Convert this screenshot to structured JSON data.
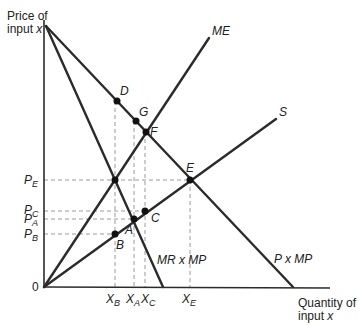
{
  "axes": {
    "y_label_line1": "Price of",
    "y_label_line2": "input ",
    "y_label_var": "x",
    "x_label_line1": "Quantity of",
    "x_label_line2": "input ",
    "x_label_var": "x",
    "origin": "0"
  },
  "curves": {
    "me": "ME",
    "s": "S",
    "mr_mp": "MR x MP",
    "p_mp": "P x MP"
  },
  "points": {
    "A": "A",
    "B": "B",
    "C": "C",
    "D": "D",
    "E": "E",
    "F": "F",
    "G": "G"
  },
  "y_ticks": {
    "pe": {
      "main": "P",
      "sub": "E"
    },
    "pc": {
      "main": "P",
      "sub": "C"
    },
    "pa": {
      "main": "P",
      "sub": "A"
    },
    "pb": {
      "main": "P",
      "sub": "B"
    }
  },
  "x_ticks": {
    "xb": {
      "main": "X",
      "sub": "B"
    },
    "xa": {
      "main": "X",
      "sub": "A"
    },
    "xc": {
      "main": "X",
      "sub": "C"
    },
    "xe": {
      "main": "X",
      "sub": "E"
    }
  },
  "colors": {
    "line": "#2b2b2b",
    "dash": "#999999"
  }
}
